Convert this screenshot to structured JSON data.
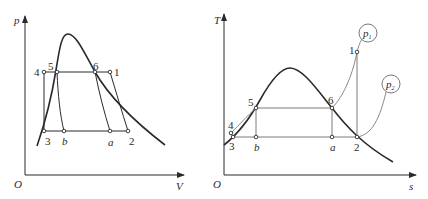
{
  "left_diagram": {
    "type": "p-V diagram",
    "axes": {
      "y_label": "p",
      "x_label": "V",
      "origin_label": "O"
    },
    "points": [
      {
        "id": "4",
        "label": "4"
      },
      {
        "id": "5",
        "label": "5"
      },
      {
        "id": "6",
        "label": "6"
      },
      {
        "id": "1",
        "label": "1"
      },
      {
        "id": "3",
        "label": "3"
      },
      {
        "id": "b",
        "label": "b"
      },
      {
        "id": "a",
        "label": "a"
      },
      {
        "id": "2",
        "label": "2"
      }
    ]
  },
  "right_diagram": {
    "type": "T-s diagram",
    "axes": {
      "y_label": "T",
      "x_label": "s",
      "origin_label": "O"
    },
    "points": [
      {
        "id": "1",
        "label": "1"
      },
      {
        "id": "5",
        "label": "5"
      },
      {
        "id": "6",
        "label": "6"
      },
      {
        "id": "4",
        "label": "4"
      },
      {
        "id": "3",
        "label": "3"
      },
      {
        "id": "b",
        "label": "b"
      },
      {
        "id": "a",
        "label": "a"
      },
      {
        "id": "2",
        "label": "2"
      }
    ],
    "isobars": [
      {
        "id": "p1",
        "label": "p",
        "subscript": "1"
      },
      {
        "id": "p2",
        "label": "p",
        "subscript": "2"
      }
    ]
  },
  "colors": {
    "line": "#2a2a2a",
    "thin_line": "#6a6a6a",
    "background": "#ffffff"
  }
}
